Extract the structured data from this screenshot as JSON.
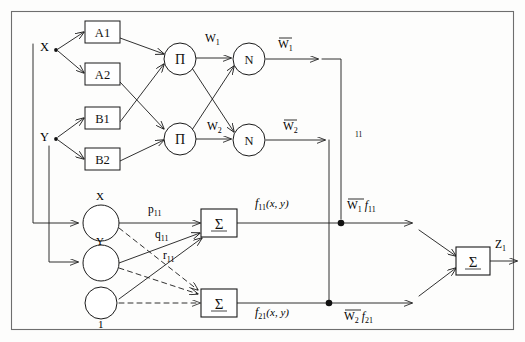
{
  "diagram": {
    "type": "neural-network-diagram",
    "border_color": "#6e6e6e",
    "line_color": "#1a1a1a",
    "background_color": "#fdfdfc"
  },
  "inputs": {
    "x_label": "X",
    "y_label": "Y"
  },
  "membership_nodes": [
    {
      "label": "A1"
    },
    {
      "label": "A2"
    },
    {
      "label": "B1"
    },
    {
      "label": "B2"
    }
  ],
  "rule_nodes": [
    {
      "label": "Π"
    },
    {
      "label": "Π"
    }
  ],
  "rule_weights": [
    {
      "label": "W",
      "sub": "1"
    },
    {
      "label": "W",
      "sub": "2"
    }
  ],
  "norm_nodes": [
    {
      "label": "N"
    },
    {
      "label": "N"
    }
  ],
  "normalized_weights": [
    {
      "label": "W",
      "sub": "1"
    },
    {
      "label": "W",
      "sub": "2"
    }
  ],
  "branch_label": "11",
  "consequent_inputs": [
    {
      "label": "X"
    },
    {
      "label": "Y"
    },
    {
      "label": "1"
    }
  ],
  "consequent_params": [
    {
      "label": "p",
      "sub": "11"
    },
    {
      "label": "q",
      "sub": "11"
    },
    {
      "label": "r",
      "sub": "11"
    }
  ],
  "sum_nodes": [
    {
      "label": "Σ"
    },
    {
      "label": "Σ"
    },
    {
      "label": "Σ"
    }
  ],
  "function_labels": [
    {
      "label": "f",
      "sub": "11",
      "args": "(x, y)"
    },
    {
      "label": "f",
      "sub": "21",
      "args": "(x, y)"
    }
  ],
  "weighted_outputs": [
    {
      "weight": "W",
      "weight_sub": "1",
      "func": "f",
      "func_sub": "11"
    },
    {
      "weight": "W",
      "weight_sub": "2",
      "func": "f",
      "func_sub": "21"
    }
  ],
  "output": {
    "label": "Z",
    "sub": "1"
  }
}
